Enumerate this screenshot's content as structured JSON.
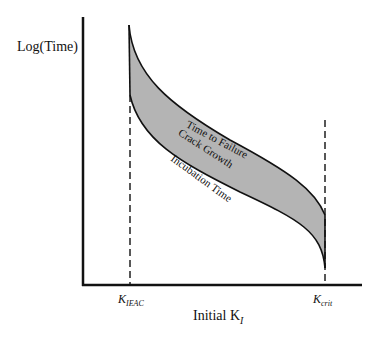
{
  "diagram": {
    "y_axis_label": "Log(Time)",
    "x_axis_label": "Initial K",
    "x_axis_label_sub": "I",
    "ticks": [
      {
        "main": "K",
        "sub": "IEAC"
      },
      {
        "main": "K",
        "sub": "crit"
      }
    ],
    "curves": {
      "upper": "Time to Failure",
      "middle": "Crack Growth",
      "lower": "Incubation Time"
    },
    "colors": {
      "fill": "#b4b4b4",
      "line": "#111111"
    }
  }
}
